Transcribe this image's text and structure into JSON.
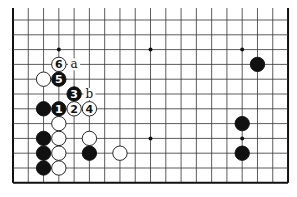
{
  "board": {
    "cols": 19,
    "rows": 12,
    "origin_x": 13,
    "origin_y": 20,
    "spacing_x": 15.28,
    "spacing_y": 14.8,
    "top_extends": true,
    "edges": {
      "left": true,
      "right": true,
      "bottom": true,
      "top": false
    },
    "line_color": "#333333",
    "edge_color": "#111111",
    "stone_black": "#111111",
    "stone_white": "#ffffff"
  },
  "star_points": [
    [
      3,
      2
    ],
    [
      9,
      2
    ],
    [
      15,
      2
    ],
    [
      9,
      8
    ],
    [
      15,
      8
    ]
  ],
  "stones": [
    {
      "color": "white",
      "col": 3,
      "row": 3,
      "label": "6"
    },
    {
      "color": "white",
      "col": 2,
      "row": 4,
      "label": ""
    },
    {
      "color": "black",
      "col": 3,
      "row": 4,
      "label": "5"
    },
    {
      "color": "black",
      "col": 4,
      "row": 5,
      "label": "3"
    },
    {
      "color": "black",
      "col": 2,
      "row": 6,
      "label": ""
    },
    {
      "color": "black",
      "col": 3,
      "row": 6,
      "label": "1"
    },
    {
      "color": "white",
      "col": 4,
      "row": 6,
      "label": "2"
    },
    {
      "color": "white",
      "col": 5,
      "row": 6,
      "label": "4"
    },
    {
      "color": "white",
      "col": 3,
      "row": 7,
      "label": ""
    },
    {
      "color": "black",
      "col": 2,
      "row": 8,
      "label": ""
    },
    {
      "color": "white",
      "col": 3,
      "row": 8,
      "label": ""
    },
    {
      "color": "white",
      "col": 5,
      "row": 8,
      "label": ""
    },
    {
      "color": "black",
      "col": 2,
      "row": 9,
      "label": ""
    },
    {
      "color": "white",
      "col": 3,
      "row": 9,
      "label": ""
    },
    {
      "color": "black",
      "col": 5,
      "row": 9,
      "label": ""
    },
    {
      "color": "white",
      "col": 7,
      "row": 9,
      "label": ""
    },
    {
      "color": "black",
      "col": 2,
      "row": 10,
      "label": ""
    },
    {
      "color": "white",
      "col": 3,
      "row": 10,
      "label": ""
    },
    {
      "color": "black",
      "col": 16,
      "row": 3,
      "label": ""
    },
    {
      "color": "black",
      "col": 15,
      "row": 7,
      "label": ""
    },
    {
      "color": "black",
      "col": 15,
      "row": 9,
      "label": ""
    }
  ],
  "markers": [
    {
      "col": 4,
      "row": 3,
      "label": "a"
    },
    {
      "col": 5,
      "row": 5,
      "label": "b"
    }
  ]
}
